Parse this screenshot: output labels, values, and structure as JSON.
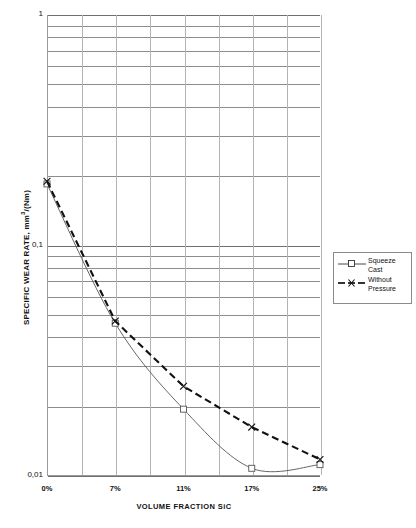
{
  "chart_data": {
    "type": "line",
    "title": "",
    "xlabel": "VOLUME FRACTION SiC",
    "ylabel": "SPECIFIC WEAR RATE, mm3/(Nm)",
    "ylabel_parts": {
      "main": "SPECIFIC WEAR RATE, mm",
      "sup": "3",
      "tail": "/(Nm)"
    },
    "categories": [
      "0%",
      "7%",
      "11%",
      "17%",
      "25%"
    ],
    "x_tick_labels": [
      "0%",
      "7%",
      "11%",
      "17%",
      "25%"
    ],
    "y_tick_labels": [
      "1",
      "0,1",
      "0,01"
    ],
    "y_tick_values": [
      1,
      0.1,
      0.01
    ],
    "ylim": [
      0.01,
      1
    ],
    "yscale": "log",
    "grid": "major and minor horizontal, vertical at category dividers",
    "legend_position": "right",
    "series": [
      {
        "name": "Squeeze Cast",
        "marker": "square",
        "linestyle": "solid",
        "color": "#555555",
        "values": [
          0.185,
          0.046,
          0.0195,
          0.0108,
          0.0112
        ]
      },
      {
        "name": "Without Pressure",
        "marker": "x",
        "linestyle": "dashed",
        "color": "#111111",
        "values": [
          0.19,
          0.047,
          0.0245,
          0.0163,
          0.0118
        ]
      }
    ]
  },
  "legend": {
    "items": [
      {
        "label": "Squeeze\nCast",
        "marker": "square",
        "style": "solid"
      },
      {
        "label": "Without\nPressure",
        "marker": "x",
        "style": "dashed"
      }
    ]
  },
  "axes": {
    "x_title": "VOLUME FRACTION SiC",
    "y_title_main": "SPECIFIC WEAR RATE, mm",
    "y_title_sup": "3",
    "y_title_tail": "/(Nm)"
  }
}
